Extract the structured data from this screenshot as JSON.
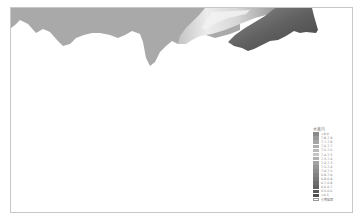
{
  "chart_data": {
    "type": "area",
    "title": "",
    "xlabel": "",
    "ylabel": "",
    "grid": false,
    "legend_position": "lower-right",
    "profile_bottom_y_px": [
      [
        12,
        26
      ],
      [
        20,
        19
      ],
      [
        30,
        22
      ],
      [
        40,
        27
      ],
      [
        50,
        30
      ],
      [
        58,
        40
      ],
      [
        64,
        45
      ],
      [
        72,
        38
      ],
      [
        82,
        35
      ],
      [
        95,
        33
      ],
      [
        105,
        34
      ],
      [
        115,
        38
      ],
      [
        125,
        35
      ],
      [
        132,
        31
      ],
      [
        140,
        35
      ],
      [
        145,
        55
      ],
      [
        150,
        65
      ],
      [
        156,
        57
      ],
      [
        162,
        48
      ],
      [
        170,
        40
      ],
      [
        178,
        44
      ],
      [
        185,
        40
      ],
      [
        195,
        30
      ],
      [
        205,
        34
      ],
      [
        215,
        38
      ],
      [
        225,
        42
      ],
      [
        235,
        46
      ],
      [
        245,
        51
      ],
      [
        252,
        49
      ],
      [
        260,
        45
      ],
      [
        268,
        41
      ],
      [
        276,
        40
      ],
      [
        285,
        36
      ],
      [
        293,
        31
      ],
      [
        300,
        32
      ],
      [
        305,
        33
      ],
      [
        315,
        32
      ],
      [
        318,
        28
      ],
      [
        318,
        7
      ]
    ],
    "zones": [
      {
        "name": "uniform mid-gray region",
        "x_range": [
          12,
          178
        ],
        "color": "#a8a8a8"
      },
      {
        "name": "light gradient band",
        "x_range": [
          178,
          260
        ],
        "color": "#e2e2e2"
      },
      {
        "name": "dark region",
        "x_range": [
          240,
          318
        ],
        "color": "#555555"
      }
    ],
    "legend": {
      "title": "水蒸汽",
      "entries": [
        {
          "label": ">8.0",
          "color": "#8a8a8a"
        },
        {
          "label": "7.8-7.9",
          "color": "#9a9a9a"
        },
        {
          "label": "7.7-7.8",
          "color": "#a6a6a6"
        },
        {
          "label": "7.6-7.7",
          "color": "#b0b0b0"
        },
        {
          "label": "7.5-7.6",
          "color": "#bcbcbc"
        },
        {
          "label": "7.4-7.5",
          "color": "#c6c6c6"
        },
        {
          "label": "7.3-7.4",
          "color": "#b2b2b2"
        },
        {
          "label": "7.2-7.3",
          "color": "#a2a2a2"
        },
        {
          "label": "7.1-7.2",
          "color": "#969696"
        },
        {
          "label": "7.0-7.1",
          "color": "#8c8c8c"
        },
        {
          "label": "6.9-7.0",
          "color": "#828282"
        },
        {
          "label": "6.8-6.9",
          "color": "#787878"
        },
        {
          "label": "6.7-6.8",
          "color": "#6e6e6e"
        },
        {
          "label": "6.6-6.7",
          "color": "#646464"
        },
        {
          "label": "6.5-6.6",
          "color": "#5a5a5a"
        },
        {
          "label": "<6.5",
          "color": "#505050"
        },
        {
          "label": "小期容器",
          "color": "#ffffff"
        }
      ]
    }
  },
  "colors": {
    "frame_border": "#c8c8c8",
    "mid_gray": "#a8a8a8",
    "light_band": "#e6e6e6",
    "dark": "#505050"
  }
}
